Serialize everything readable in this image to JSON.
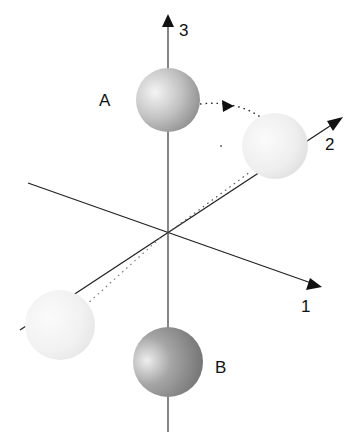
{
  "diagram": {
    "axes": [
      {
        "id": "1",
        "label": "1"
      },
      {
        "id": "2",
        "label": "2"
      },
      {
        "id": "3",
        "label": "3"
      }
    ],
    "spheres": [
      {
        "id": "A",
        "label": "A",
        "position": "on axis 3, above origin"
      },
      {
        "id": "B",
        "label": "B",
        "position": "on axis 3, below origin"
      },
      {
        "id": "ghost-right",
        "label": "",
        "position": "on axis 2, positive side"
      },
      {
        "id": "ghost-left",
        "label": "",
        "position": "on axis 2, negative side"
      }
    ],
    "colors": {
      "axis": "#222222",
      "sphere_solid": "#a8a8a8",
      "sphere_ghost": "#e6e6e6"
    }
  }
}
